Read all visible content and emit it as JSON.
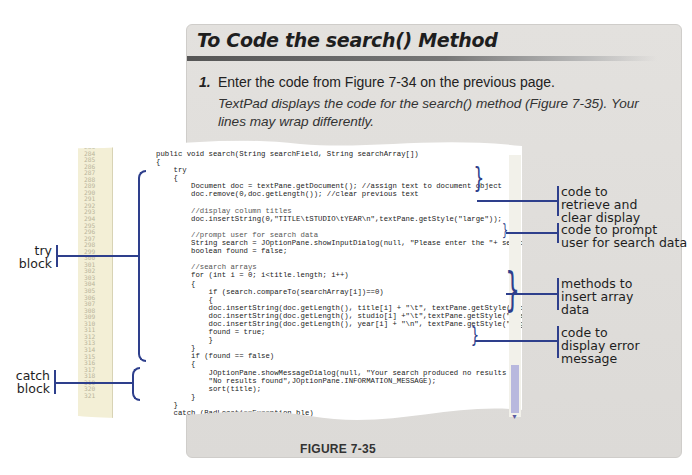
{
  "panel": {
    "title": "To Code the search() Method",
    "step_number": "1.",
    "step_text": "Enter the code from Figure 7-34 on the previous page.",
    "step_result": "TextPad displays the code for the search() method (Figure 7-35). Your lines may wrap differently."
  },
  "figure": {
    "caption": "FIGURE 7-35",
    "line_numbers": "283\n284\n285\n286\n287\n288\n289\n290\n291\n292\n293\n294\n295\n296\n297\n298\n299\n300\n301\n302\n303\n304\n305\n306\n307\n308\n309\n310\n311\n312\n313\n314\n315\n316\n317\n318\n319\n320\n321",
    "code_lines": [
      "public void search(String searchField, String searchArray[])",
      "{",
      "    try",
      "    {",
      "        Document doc = textPane.getDocument(); //assign text to document object",
      "        doc.remove(0,doc.getLength()); //clear previous text",
      "",
      "        //display column titles",
      "        doc.insertString(0,\"TITLE\\tSTUDIO\\tYEAR\\n\",textPane.getStyle(\"large\"));",
      "",
      "        //prompt user for search data",
      "        String search = JOptionPane.showInputDialog(null, \"Please enter the \"+ searchField);",
      "        boolean found = false;",
      "",
      "        //search arrays",
      "        for (int i = 0; i<title.length; i++)",
      "        {",
      "            if (search.compareTo(searchArray[i])==0)",
      "            {",
      "            doc.insertString(doc.getLength(), title[i] + \"\\t\", textPane.getStyle(\"bold\"));",
      "            doc.insertString(doc.getLength(), studio[i] +\"\\t\",textPane.getStyle(\"italic\"));",
      "            doc.insertString(doc.getLength(), year[i] + \"\\n\", textPane.getStyle(\"regular\"));",
      "            found = true;",
      "            }",
      "        }",
      "        if (found == false)",
      "        {",
      "            JOptionPane.showMessageDialog(null, \"Your search produced no results \",",
      "            \"No results found\",JOptionPane.INFORMATION_MESSAGE);",
      "            sort(title);",
      "        }",
      "    }",
      "    catch (BadLocationException ble)",
      "    {",
      "        System.err.println(\"Couldn't insert text.\");",
      "    }",
      "}"
    ]
  },
  "callouts": {
    "retrieve": [
      "code to",
      "retrieve and",
      "clear display"
    ],
    "prompt": [
      "code to prompt",
      "user for search data"
    ],
    "insert": [
      "methods to",
      "insert array",
      "data"
    ],
    "error": [
      "code to",
      "display error",
      "message"
    ],
    "try_block": [
      "try",
      "block"
    ],
    "catch_block": [
      "catch",
      "block"
    ]
  },
  "colors": {
    "bracket_blue": "#2e3f8c",
    "panel_gray": "#dedcd9",
    "gutter_cream": "#f3efd6"
  }
}
